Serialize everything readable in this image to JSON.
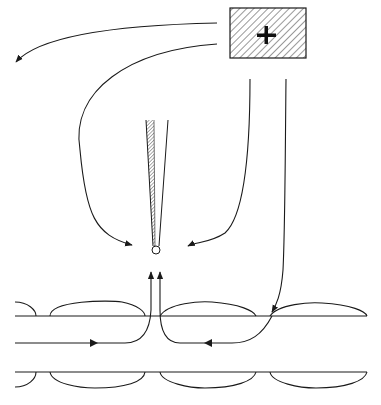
{
  "diagram": {
    "type": "schematic",
    "colors": {
      "stroke": "#1a1a1a",
      "background": "#ffffff",
      "hatch": "#333333"
    },
    "stimulating_electrode": {
      "shape": "hatched-rectangle",
      "symbol": "+",
      "x": 230,
      "y": 8,
      "width": 76,
      "height": 50
    },
    "recording_pipette": {
      "shape": "tapered-tube",
      "tip": {
        "x": 156,
        "y": 250,
        "r": 4
      },
      "top_left_x": 146,
      "top_right_x": 168,
      "top_y": 120,
      "shaft_hatched": true
    },
    "axon": {
      "upper_membrane_y": 316,
      "axis_y": 343,
      "lower_membrane_y": 372,
      "x_start": 15,
      "x_end": 367,
      "myelin_segments": [
        {
          "x1": 15,
          "x2": 35,
          "partial": true
        },
        {
          "x1": 50,
          "x2": 145
        },
        {
          "x1": 160,
          "x2": 255
        },
        {
          "x1": 270,
          "x2": 367
        }
      ],
      "node_gaps_x": [
        42,
        152,
        263
      ]
    },
    "current_paths": [
      {
        "id": "to-left",
        "from": "box-left",
        "to": "far-left",
        "arrow": "end"
      },
      {
        "id": "to-tip-left",
        "from": "box-left",
        "to": "pipette-tip-left",
        "arrow": "end"
      },
      {
        "id": "to-tip-right",
        "from": "box-bottom",
        "to": "pipette-tip-right",
        "arrow": "end"
      },
      {
        "id": "to-axon",
        "from": "box-bottom",
        "to": "axon-node",
        "arrow": "mid"
      },
      {
        "id": "axon-left-loop",
        "from": "axon-axis-left",
        "to": "node-up",
        "arrow": "mid-and-end"
      },
      {
        "id": "axon-right-loop",
        "from": "axon-node-right",
        "to": "node-up",
        "arrow": "mid-and-end"
      }
    ]
  },
  "caption": {
    "text": ""
  }
}
